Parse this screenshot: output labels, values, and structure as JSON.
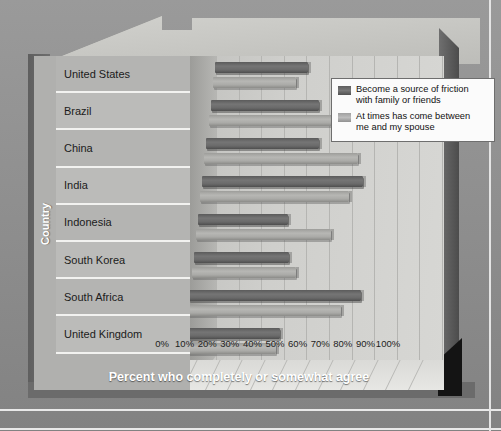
{
  "chart_data": {
    "type": "bar",
    "orientation": "horizontal",
    "title": "",
    "xlabel": "Percent who completely or somewhat agree",
    "ylabel": "Country",
    "xlim": [
      0,
      100
    ],
    "xticks": [
      "0%",
      "10%",
      "20%",
      "30%",
      "40%",
      "50%",
      "60%",
      "70%",
      "80%",
      "90%",
      "100%"
    ],
    "grid": true,
    "legend_position": "top-right",
    "categories": [
      "United States",
      "Brazil",
      "China",
      "India",
      "Indonesia",
      "South Korea",
      "South Africa",
      "United Kingdom"
    ],
    "series": [
      {
        "name": "Become a source of friction with family or friends",
        "color": "#6a6a6a",
        "values": [
          41,
          48,
          50,
          71,
          40,
          42,
          76,
          42
        ]
      },
      {
        "name": "At times has come between me and my spouse",
        "color": "#ababa8",
        "values": [
          37,
          57,
          68,
          66,
          60,
          46,
          68,
          41
        ]
      }
    ]
  },
  "legend": {
    "items": [
      {
        "label_line1": "Become a source of friction",
        "label_line2": "with family or friends",
        "swatch": "dark"
      },
      {
        "label_line1": "At times has come between",
        "label_line2": "me and my spouse",
        "swatch": "light"
      }
    ]
  },
  "axis": {
    "x_title": "Percent who completely or somewhat agree",
    "y_title": "Country"
  }
}
